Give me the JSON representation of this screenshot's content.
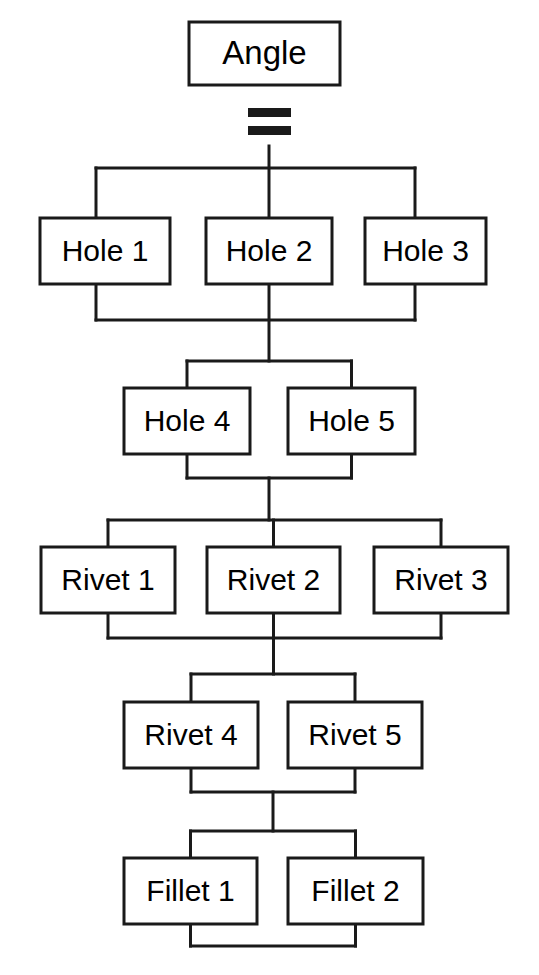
{
  "diagram": {
    "title": "Angle",
    "type": "feature-tree",
    "background_color": "#ffffff",
    "line_color": "#1a1a1a",
    "box_fill": "#ffffff",
    "text_color": "#000000",
    "equals_symbol": "=",
    "root": {
      "label": "Angle",
      "x": 189,
      "y": 22,
      "w": 151,
      "h": 63,
      "cx": 264.5,
      "cy": 53.5
    },
    "levels": [
      {
        "name": "holes-upper",
        "nodes": [
          {
            "label": "Hole 1",
            "x": 40,
            "y": 218,
            "w": 130,
            "h": 66,
            "cx": 105,
            "cy": 251
          },
          {
            "label": "Hole 2",
            "x": 206,
            "y": 218,
            "w": 126,
            "h": 66,
            "cx": 269,
            "cy": 251
          },
          {
            "label": "Hole 3",
            "x": 365,
            "y": 218,
            "w": 121,
            "h": 66,
            "cx": 425.5,
            "cy": 251
          }
        ],
        "bus_top_y": 168,
        "bus_bottom_y": 320
      },
      {
        "name": "holes-lower",
        "nodes": [
          {
            "label": "Hole 4",
            "x": 124,
            "y": 388,
            "w": 126,
            "h": 66,
            "cx": 187,
            "cy": 421
          },
          {
            "label": "Hole 5",
            "x": 288,
            "y": 388,
            "w": 127,
            "h": 66,
            "cx": 351.5,
            "cy": 421
          }
        ],
        "bus_top_y": 361,
        "bus_bottom_y": 478
      },
      {
        "name": "rivets-upper",
        "nodes": [
          {
            "label": "Rivet 1",
            "x": 41,
            "y": 547,
            "w": 134,
            "h": 66,
            "cx": 108,
            "cy": 580
          },
          {
            "label": "Rivet 2",
            "x": 207,
            "y": 547,
            "w": 133,
            "h": 66,
            "cx": 273.5,
            "cy": 580
          },
          {
            "label": "Rivet 3",
            "x": 374,
            "y": 547,
            "w": 134,
            "h": 66,
            "cx": 441,
            "cy": 580
          }
        ],
        "bus_top_y": 520,
        "bus_bottom_y": 638
      },
      {
        "name": "rivets-lower",
        "nodes": [
          {
            "label": "Rivet 4",
            "x": 124,
            "y": 702,
            "w": 134,
            "h": 66,
            "cx": 191,
            "cy": 735
          },
          {
            "label": "Rivet 5",
            "x": 288,
            "y": 702,
            "w": 134,
            "h": 66,
            "cx": 355,
            "cy": 735
          }
        ],
        "bus_top_y": 674,
        "bus_bottom_y": 792
      },
      {
        "name": "fillets",
        "nodes": [
          {
            "label": "Fillet 1",
            "x": 124,
            "y": 858,
            "w": 133,
            "h": 66,
            "cx": 190.5,
            "cy": 891
          },
          {
            "label": "Fillet 2",
            "x": 288,
            "y": 858,
            "w": 135,
            "h": 66,
            "cx": 355.5,
            "cy": 891
          }
        ],
        "bus_top_y": 831,
        "bus_bottom_y": 946
      }
    ],
    "spine_x": 269
  }
}
